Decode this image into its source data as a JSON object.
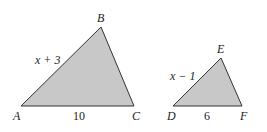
{
  "figure": {
    "colors": {
      "fill": "#c8c8c8",
      "stroke": "#333333",
      "text": "#222222"
    },
    "triangles": [
      {
        "name": "ABC",
        "vertices": [
          {
            "label": "A",
            "x": 21,
            "y": 106
          },
          {
            "label": "B",
            "x": 101,
            "y": 27
          },
          {
            "label": "C",
            "x": 134,
            "y": 106
          }
        ],
        "sides": [
          {
            "between": "AB",
            "label": "x + 3"
          },
          {
            "between": "AC",
            "label": "10"
          }
        ]
      },
      {
        "name": "DEF",
        "vertices": [
          {
            "label": "D",
            "x": 173,
            "y": 106
          },
          {
            "label": "E",
            "x": 221,
            "y": 58
          },
          {
            "label": "F",
            "x": 242,
            "y": 106
          }
        ],
        "sides": [
          {
            "between": "DE",
            "label": "x − 1"
          },
          {
            "between": "DF",
            "label": "6"
          }
        ]
      }
    ]
  }
}
